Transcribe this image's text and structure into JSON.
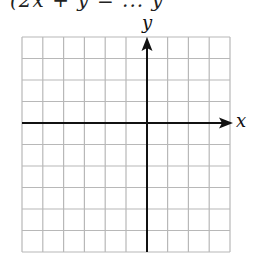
{
  "header": {
    "partial_text": "(2x + y = ... y"
  },
  "graph": {
    "type": "coordinate-grid",
    "x_axis_label": "x",
    "y_axis_label": "y",
    "grid_columns": 10,
    "grid_rows": 10,
    "columns_left_of_y_axis": 6,
    "columns_right_of_y_axis": 4,
    "rows_above_x_axis": 4,
    "rows_below_x_axis": 6,
    "grid_color": "#b8b8b8",
    "axis_color": "#111111"
  }
}
